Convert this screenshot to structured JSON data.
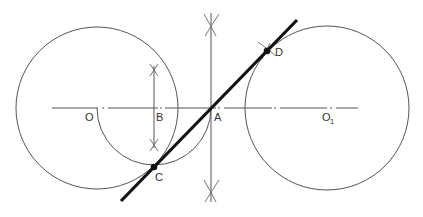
{
  "diagram": {
    "title": "",
    "labels": {
      "O": "O",
      "B": "B",
      "A": "A",
      "C": "C",
      "D": "D",
      "O1_main": "O",
      "O1_sub": "1"
    },
    "colors": {
      "thin_line": "#555555",
      "tangent_line": "#111111",
      "background": "#ffffff"
    }
  }
}
